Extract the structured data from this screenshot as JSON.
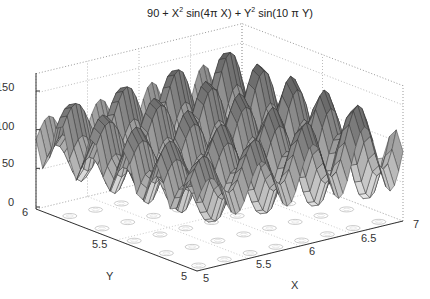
{
  "chart_data": {
    "type": "surface",
    "title_parts": {
      "a": "90 + X",
      "b": "2",
      "c": " sin(4π X) + Y",
      "d": "2",
      "e": " sin(10 π Y)"
    },
    "xlabel": "X",
    "ylabel": "Y",
    "zlabel": "",
    "xlim": [
      5,
      7
    ],
    "ylim": [
      5,
      6
    ],
    "zlim": [
      0,
      175
    ],
    "x_ticks": [
      "5",
      "5.5",
      "6",
      "6.5",
      "7"
    ],
    "y_ticks": [
      "5",
      "5.5",
      "6"
    ],
    "z_ticks": [
      "0",
      "50",
      "100",
      "150"
    ],
    "function": {
      "const": 90,
      "x_freq_pi": 4,
      "y_freq_pi": 10
    },
    "grid": true,
    "contour_on_floor": true,
    "colormap": "gray",
    "mesh_resolution": {
      "nx": 48,
      "ny": 24
    }
  }
}
